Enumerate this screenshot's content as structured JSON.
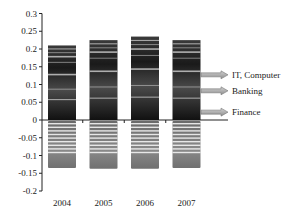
{
  "chart_data": {
    "type": "bar",
    "title": "",
    "xlabel": "",
    "ylabel": "",
    "categories": [
      "2004",
      "2005",
      "2006",
      "2007"
    ],
    "series": [
      {
        "name": "Positive component (IT, Computer / Banking / Finance sectors)",
        "values": [
          0.21,
          0.225,
          0.235,
          0.225
        ]
      },
      {
        "name": "Negative component",
        "values": [
          -0.135,
          -0.137,
          -0.137,
          -0.135
        ]
      }
    ],
    "ylim": [
      -0.2,
      0.3
    ],
    "yticks": [
      0.3,
      0.25,
      0.2,
      0.15,
      0.1,
      0.05,
      0,
      -0.05,
      -0.1,
      -0.15,
      -0.2
    ],
    "ytick_labels": [
      "0.3",
      "0.25",
      "0.2",
      "0.15",
      "0.1",
      "0.05",
      "0",
      "-0.05",
      "-0.1",
      "-0.15",
      "-0.2"
    ],
    "grid": false,
    "annotations": [
      {
        "label": "IT, Computer",
        "y_value": 0.13
      },
      {
        "label": "Banking",
        "y_value": 0.085
      },
      {
        "label": "Finance",
        "y_value": 0.025
      }
    ],
    "legend_position": "right"
  },
  "colors": {
    "bar_dark": "#1e1e1e",
    "bar_mid": "#555555",
    "bar_light": "#8a8a8a",
    "stripe": "#e8e8e8",
    "arrow_fill": "#b0b0b0",
    "arrow_stroke": "#777777",
    "axis": "#222222"
  }
}
